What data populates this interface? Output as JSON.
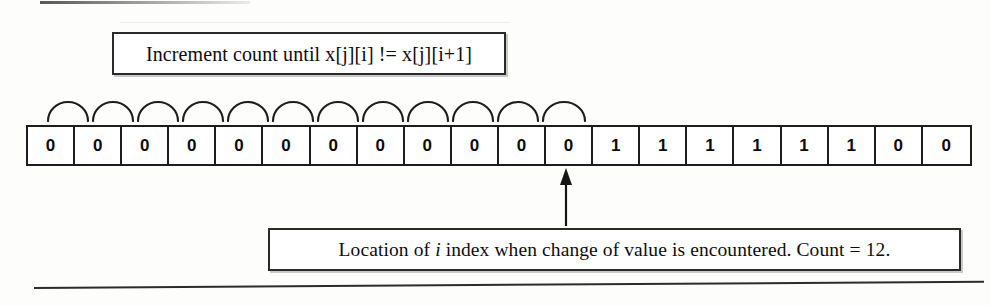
{
  "figure": {
    "type": "array-traversal-diagram",
    "background_color": "#fdfdfc",
    "ink_color": "#1d1d1d"
  },
  "callout_top": {
    "label": "Increment count until x[j][i] != x[j][i+1]"
  },
  "callout_bottom": {
    "text_before_italic": "Location of ",
    "italic_token": "i",
    "text_after_italic": " index when change of value is encountered.  Count = 12."
  },
  "array": {
    "name": "x[j]",
    "cell_count": 20,
    "cells": [
      "0",
      "0",
      "0",
      "0",
      "0",
      "0",
      "0",
      "0",
      "0",
      "0",
      "0",
      "0",
      "1",
      "1",
      "1",
      "1",
      "1",
      "1",
      "0",
      "0"
    ]
  },
  "arcs": {
    "count": 12,
    "description": "semicircular hop arcs over the first twelve cells"
  },
  "pointer": {
    "target_cell_index": 12,
    "direction": "up"
  }
}
